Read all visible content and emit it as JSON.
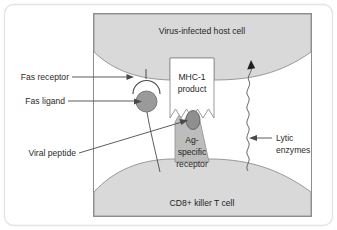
{
  "figure": {
    "outer_frame_color": "#e2e2e2",
    "panel_border_color": "#8a8a8a",
    "panel_background": "#ffffff",
    "cell_fill": "#d9d9d9",
    "cell_stroke": "#8f8f8f",
    "receptor_fill": "#bdbdbd",
    "ligand_fill": "#9a9a9a",
    "peptide_fill": "#8f8f8f",
    "mhc_fill": "#ffffff",
    "line_color": "#4a4a4a",
    "text_color": "#2b2b2b"
  },
  "labels": {
    "host_cell": "Virus-infected host cell",
    "t_cell": "CD8+ killer T cell",
    "fas_receptor": "Fas receptor",
    "fas_ligand": "Fas ligand",
    "viral_peptide": "Viral peptide",
    "lytic_enzymes_line1": "Lytic",
    "lytic_enzymes_line2": "enzymes",
    "mhc_line1": "MHC-1",
    "mhc_line2": "product",
    "ag_receptor_line1": "Ag-",
    "ag_receptor_line2": "specific",
    "ag_receptor_line3": "receptor"
  },
  "icons": {
    "lytic_arrow": "arrow-up-icon",
    "fas_receptor_cup": "receptor-cup-icon",
    "fas_ligand_circle": "ligand-circle-icon",
    "peptide_oval": "peptide-oval-icon",
    "squiggle": "wavy-line-icon"
  }
}
